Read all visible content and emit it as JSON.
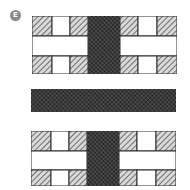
{
  "badge": {
    "label": "E"
  },
  "colors": {
    "stroke": "#2a2a2a",
    "hatch_light": "#6f6f6f",
    "dark_fill": "#2b2b2b",
    "background": "#ffffff",
    "badge": "#8a8a8a"
  },
  "figure": {
    "top_block": {
      "columns": [
        "hatched",
        "white",
        "hatched",
        "dark",
        "hatched",
        "white",
        "hatched"
      ]
    },
    "middle_bar": {
      "fill": "dark"
    },
    "bottom_block": {
      "columns": [
        "hatched",
        "white",
        "hatched",
        "dark",
        "hatched",
        "white",
        "hatched"
      ]
    }
  }
}
